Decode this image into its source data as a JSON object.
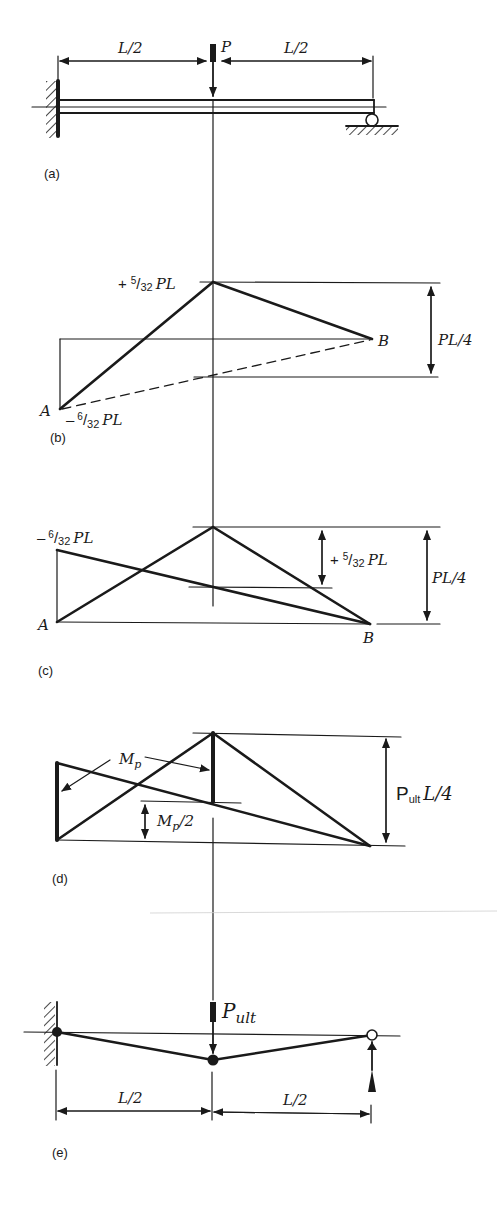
{
  "colors": {
    "ink": "#1a1a1a",
    "background": "#ffffff",
    "scan_line": "#cfcfcf"
  },
  "panels": {
    "a": {
      "caption": "(a)",
      "load_label": "P",
      "span_left_label": "L/2",
      "span_right_label": "L/2"
    },
    "b": {
      "caption": "(b)",
      "top_value_label": "+ 5/32 PL",
      "top_sign": "+",
      "top_num": "5",
      "top_den": "32",
      "top_suffix": "PL",
      "bottom_sign": "–",
      "bottom_num": "6",
      "bottom_den": "32",
      "bottom_suffix": "PL",
      "point_a": "A",
      "point_b": "B",
      "range_label": "PL/4"
    },
    "c": {
      "caption": "(c)",
      "left_sign": "–",
      "left_num": "6",
      "left_den": "32",
      "left_suffix": "PL",
      "mid_sign": "+",
      "mid_num": "5",
      "mid_den": "32",
      "mid_suffix": "PL",
      "point_a": "A",
      "point_b": "B",
      "range_label": "PL/4"
    },
    "d": {
      "caption": "(d)",
      "mp_label": "M",
      "mp_sub": "p",
      "mp_half_label": "M",
      "mp_half_sub": "p",
      "mp_half_suffix": "/2",
      "range_main": "P",
      "range_sub": "ult",
      "range_suffix": "L/4"
    },
    "e": {
      "caption": "(e)",
      "load_main": "P",
      "load_sub": "ult",
      "span_left_label": "L/2",
      "span_right_label": "L/2"
    }
  }
}
